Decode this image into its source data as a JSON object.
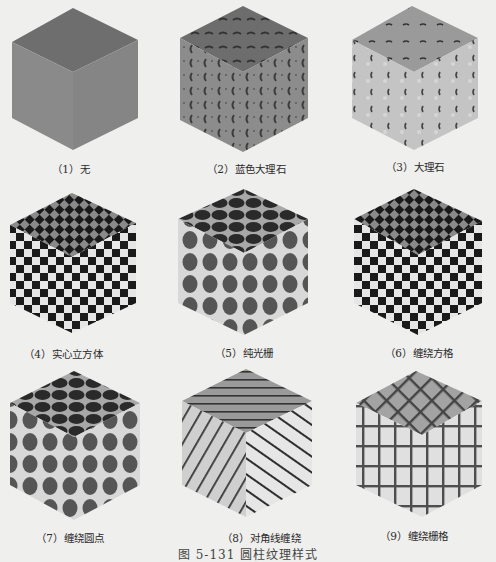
{
  "figure": {
    "caption": "图 5-131  圆柱纹理样式",
    "items": [
      {
        "label": "（1）无",
        "texture": "none"
      },
      {
        "label": "（2）蓝色大理石",
        "texture": "blue-marble"
      },
      {
        "label": "（3）大理石",
        "texture": "marble"
      },
      {
        "label": "（4）实心立方体",
        "texture": "solid-cube-checker"
      },
      {
        "label": "（5）纯光栅",
        "texture": "plain-raster-dots"
      },
      {
        "label": "（6）缠绕方格",
        "texture": "wrapped-checker"
      },
      {
        "label": "（7）缠绕圆点",
        "texture": "wrapped-dots"
      },
      {
        "label": "（8）对角线缠绕",
        "texture": "diagonal-wrap"
      },
      {
        "label": "（9）缠绕栅格",
        "texture": "wrapped-grid"
      }
    ]
  },
  "colors": {
    "background": "#efefed",
    "cube_top": "#6f6f6f",
    "cube_side": "#8a8a8a",
    "checker_dark": "#1a1a1a",
    "checker_light": "#e8e8e8",
    "dot": "#555555",
    "grid_line": "#505050"
  }
}
